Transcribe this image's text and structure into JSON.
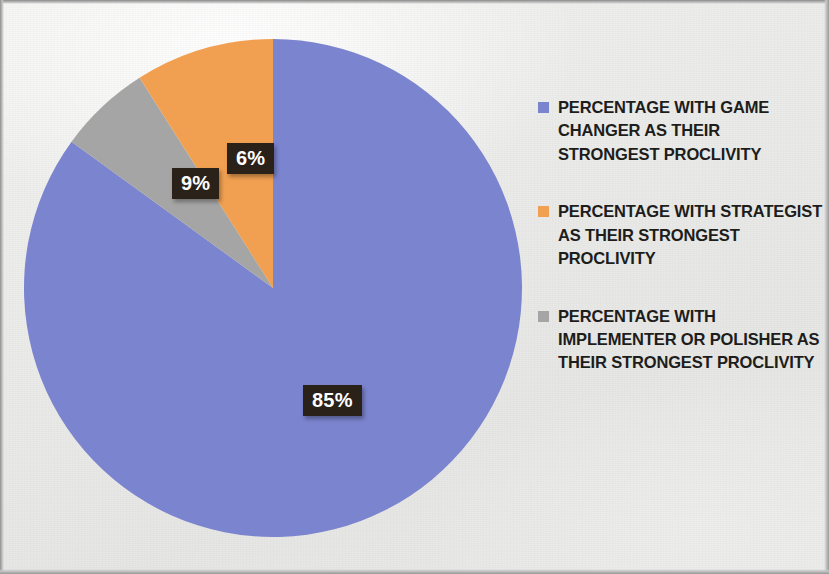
{
  "chart_data": {
    "type": "pie",
    "title": "",
    "subtitle": "",
    "categories": [
      "PERCENTAGE WITH GAME CHANGER AS THEIR STRONGEST PROCLIVITY",
      "PERCENTAGE  WITH STRATEGIST AS THEIR STRONGEST PROCLIVITY",
      "PERCENTAGE WITH IMPLEMENTER OR POLISHER AS THEIR STRONGEST PROCLIVITY"
    ],
    "values": [
      85,
      9,
      6
    ],
    "value_labels": [
      "85%",
      "9%",
      "6%"
    ],
    "colors": [
      "#7b84ce",
      "#f0a050",
      "#a5a5a5"
    ],
    "legend_position": "right",
    "start_angle_deg": 0,
    "direction": "clockwise",
    "grid": false
  },
  "pie": {
    "slices": [
      {
        "key": "game-changer",
        "label": "85%",
        "value": 85,
        "color": "#7b84ce"
      },
      {
        "key": "implementer-polisher",
        "label": "6%",
        "value": 6,
        "color": "#a5a5a5"
      },
      {
        "key": "strategist",
        "label": "9%",
        "value": 9,
        "color": "#f0a050"
      }
    ]
  },
  "labels": {
    "blue": "85%",
    "orange": "9%",
    "gray": "6%"
  },
  "legend": {
    "items": [
      {
        "swatch_color": "#7b84ce",
        "swatch_name": "legend-swatch-blue",
        "label": "PERCENTAGE WITH GAME CHANGER AS THEIR STRONGEST PROCLIVITY"
      },
      {
        "swatch_color": "#f0a050",
        "swatch_name": "legend-swatch-orange",
        "label": "PERCENTAGE  WITH STRATEGIST AS THEIR STRONGEST PROCLIVITY"
      },
      {
        "swatch_color": "#a5a5a5",
        "swatch_name": "legend-swatch-gray",
        "label": "PERCENTAGE WITH IMPLEMENTER OR POLISHER AS THEIR STRONGEST PROCLIVITY"
      }
    ]
  },
  "colors": {
    "blue": "#7b84ce",
    "orange": "#f0a050",
    "gray": "#a5a5a5",
    "label_background": "#2a2119",
    "label_text": "#ffffff",
    "legend_text": "#1d1d1b"
  }
}
